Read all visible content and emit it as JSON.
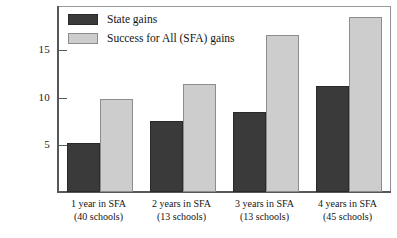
{
  "chart_data": {
    "type": "bar",
    "title": "",
    "xlabel": "",
    "ylabel": "",
    "ylim": [
      0,
      19.6
    ],
    "grid": false,
    "legend_position": "top-left",
    "categories": [
      "1 year in SFA\n(40 schools)",
      "2 years in SFA\n(13 schools)",
      "3 years in SFA\n(13 schools)",
      "4 years in SFA\n(45 schools)"
    ],
    "category_lines": [
      {
        "line1": "1 year in SFA",
        "line2": "(40 schools)"
      },
      {
        "line1": "2 years in SFA",
        "line2": "(13 schools)"
      },
      {
        "line1": "3 years in SFA",
        "line2": "(13 schools)"
      },
      {
        "line1": "4 years in SFA",
        "line2": "(45 schools)"
      }
    ],
    "series": [
      {
        "name": "State gains",
        "color": "#3a3a3a",
        "values": [
          5.2,
          7.5,
          8.5,
          11.2
        ]
      },
      {
        "name": "Success for All (SFA) gains",
        "color": "#cdcdcd",
        "values": [
          9.9,
          11.4,
          16.6,
          18.5
        ]
      }
    ],
    "yticks": [
      5,
      10,
      15
    ],
    "ytick_labels": [
      "5",
      "10",
      "15"
    ]
  },
  "legend": {
    "items": [
      {
        "label": "State gains",
        "swatch": "dark"
      },
      {
        "label": "Success for All (SFA) gains",
        "swatch": "light"
      }
    ]
  },
  "colors": {
    "dark_bar": "#3a3a3a",
    "light_bar": "#cdcdcd",
    "axis": "#55595c",
    "frame": "#8e8e8e",
    "background": "#ffffff"
  }
}
